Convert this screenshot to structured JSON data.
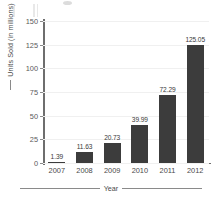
{
  "chart_data": {
    "type": "bar",
    "title": "",
    "subtitle": "",
    "xlabel": "Year",
    "ylabel": "Units Sold (in millions)",
    "categories": [
      "2007",
      "2008",
      "2009",
      "2010",
      "2011",
      "2012"
    ],
    "values": [
      1.39,
      11.63,
      20.73,
      39.99,
      72.29,
      125.05
    ],
    "value_labels": [
      "1.39",
      "11.63",
      "20.73",
      "39.99",
      "72.29",
      "125.05"
    ],
    "ylim": [
      0,
      150
    ],
    "yticks": [
      150,
      125,
      100,
      75,
      50,
      25,
      0
    ],
    "ytick_labels": [
      "150",
      "125",
      "100",
      "75",
      "50",
      "25",
      "0"
    ],
    "grid": true,
    "grid_orientation": "horizontal",
    "legend": false,
    "legend_position": "none",
    "bar_color": "#3c3c3c",
    "gridline_color": "#f0f0f0",
    "axis_color": "#6e6e6e",
    "background_color": "#ffffff",
    "text_color": "#4a4a4a"
  }
}
